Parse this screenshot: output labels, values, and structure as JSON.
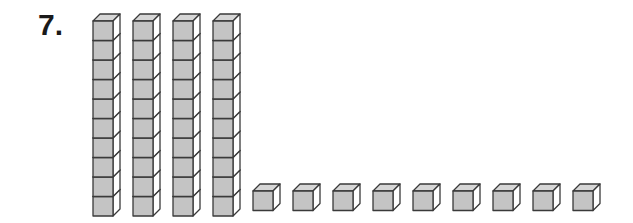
{
  "problem": {
    "number_label": "7.",
    "tens_rods": 4,
    "cubes_per_rod": 10,
    "ones_cubes": 9,
    "represented_value": 49
  },
  "colors": {
    "face": "#c4c4c4",
    "side": "#ffffff",
    "top": "#d6d6d6",
    "stroke": "#3a3a3a"
  }
}
